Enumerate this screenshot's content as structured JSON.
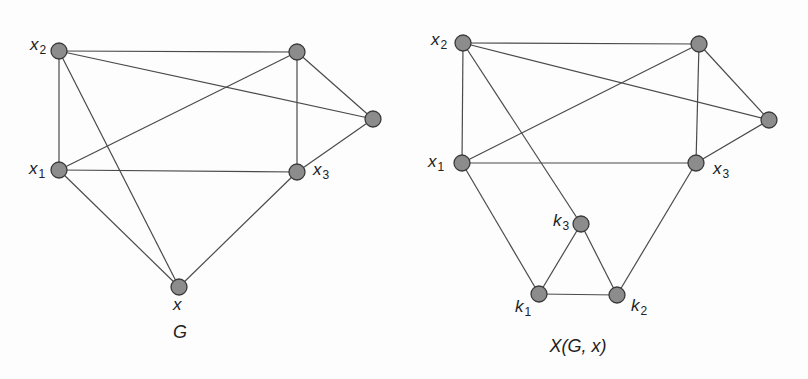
{
  "figures": [
    {
      "id": "G",
      "caption": "G",
      "caption_pos": [
        180,
        322
      ],
      "nodes": [
        {
          "id": "x2",
          "x": 59,
          "y": 51,
          "label": "x",
          "sub": "2",
          "label_pos": [
            30,
            36
          ]
        },
        {
          "id": "tr",
          "x": 297,
          "y": 52,
          "label": "",
          "sub": ""
        },
        {
          "id": "r",
          "x": 373,
          "y": 119,
          "label": "",
          "sub": ""
        },
        {
          "id": "x1",
          "x": 59,
          "y": 170,
          "label": "x",
          "sub": "1",
          "label_pos": [
            29,
            160
          ]
        },
        {
          "id": "x3",
          "x": 297,
          "y": 172,
          "label": "x",
          "sub": "3",
          "label_pos": [
            313,
            161
          ]
        },
        {
          "id": "x",
          "x": 179,
          "y": 287,
          "label": "x",
          "sub": "",
          "label_pos": [
            173,
            296
          ]
        }
      ],
      "edges": [
        [
          "x2",
          "tr"
        ],
        [
          "x2",
          "r"
        ],
        [
          "x2",
          "x1"
        ],
        [
          "x2",
          "x"
        ],
        [
          "tr",
          "x1"
        ],
        [
          "tr",
          "x3"
        ],
        [
          "tr",
          "r"
        ],
        [
          "r",
          "x3"
        ],
        [
          "x1",
          "x3"
        ],
        [
          "x1",
          "x"
        ],
        [
          "x3",
          "x"
        ]
      ]
    },
    {
      "id": "XGx",
      "caption": "X(G, x)",
      "caption_pos": [
        578,
        336
      ],
      "nodes": [
        {
          "id": "x2",
          "x": 463,
          "y": 43,
          "label": "x",
          "sub": "2",
          "label_pos": [
            431,
            31
          ]
        },
        {
          "id": "tr",
          "x": 699,
          "y": 44,
          "label": "",
          "sub": ""
        },
        {
          "id": "r",
          "x": 769,
          "y": 120,
          "label": "",
          "sub": ""
        },
        {
          "id": "x1",
          "x": 462,
          "y": 163,
          "label": "x",
          "sub": "1",
          "label_pos": [
            428,
            153
          ]
        },
        {
          "id": "x3",
          "x": 696,
          "y": 163,
          "label": "x",
          "sub": "3",
          "label_pos": [
            713,
            160
          ]
        },
        {
          "id": "k3",
          "x": 581,
          "y": 224,
          "label": "k",
          "sub": "3",
          "label_pos": [
            553,
            212
          ]
        },
        {
          "id": "k1",
          "x": 539,
          "y": 294,
          "label": "k",
          "sub": "1",
          "label_pos": [
            515,
            298
          ]
        },
        {
          "id": "k2",
          "x": 617,
          "y": 295,
          "label": "k",
          "sub": "2",
          "label_pos": [
            631,
            297
          ]
        }
      ],
      "edges": [
        [
          "x2",
          "tr"
        ],
        [
          "x2",
          "r"
        ],
        [
          "x2",
          "x1"
        ],
        [
          "x2",
          "k3"
        ],
        [
          "tr",
          "x1"
        ],
        [
          "tr",
          "x3"
        ],
        [
          "tr",
          "r"
        ],
        [
          "r",
          "x3"
        ],
        [
          "x1",
          "x3"
        ],
        [
          "x1",
          "k1"
        ],
        [
          "x3",
          "k2"
        ],
        [
          "k3",
          "k1"
        ],
        [
          "k3",
          "k2"
        ],
        [
          "k1",
          "k2"
        ]
      ]
    }
  ],
  "style": {
    "node_fill": "#8c8c8c",
    "node_stroke": "#3a3a3a",
    "edge_color": "#4a4a4a",
    "node_radius": 8
  }
}
